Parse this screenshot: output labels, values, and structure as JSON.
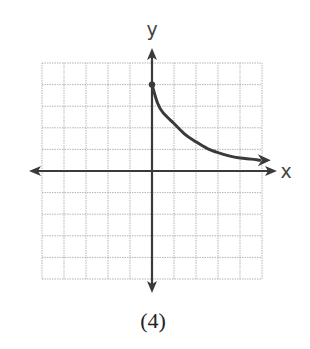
{
  "figure_label": "(4)",
  "chart_data": {
    "type": "line",
    "title": "",
    "caption": "(4)",
    "xlabel": "x",
    "ylabel": "y",
    "xlim": [
      -5,
      5
    ],
    "ylim": [
      -5,
      5
    ],
    "grid": true,
    "grid_step": 1,
    "tick_labels": false,
    "axes_arrows": true,
    "series": [
      {
        "name": "curve",
        "start_point": {
          "x": 0,
          "y": 4,
          "closed_dot": true
        },
        "end_arrow": true,
        "x": [
          0,
          0.25,
          0.5,
          1,
          1.5,
          2,
          2.5,
          3,
          3.5,
          4,
          4.5,
          4.9
        ],
        "y": [
          4,
          3.15,
          2.7,
          2.2,
          1.7,
          1.35,
          1.05,
          0.85,
          0.7,
          0.6,
          0.55,
          0.5
        ]
      }
    ],
    "colors": {
      "axis": "#3a3a3a",
      "grid": "#b5b5b5",
      "curve": "#3a3a3a"
    }
  }
}
